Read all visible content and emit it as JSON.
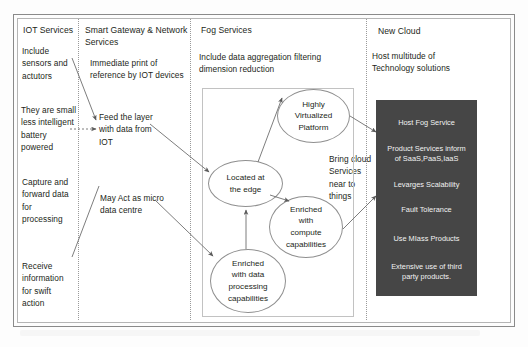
{
  "diagram": {
    "columns": [
      {
        "id": "iot",
        "header": "IOT Services",
        "notes": [
          "Include\nsensors and\nactutors",
          "They are small\nless intelligent\nbattery\npowered",
          "Capture and\nforward data\nfor\nprocessing",
          "Receive\ninformation\nfor swift\naction"
        ]
      },
      {
        "id": "gateway",
        "header": "Smart Gateway & Network\nServices",
        "notes": [
          "Immediate print of\nreference by IOT devices",
          "Feed the layer\nwith data from\nIOT",
          "May Act as micro\ndata centre"
        ]
      },
      {
        "id": "fog",
        "header": "Fog Services",
        "notes": [
          "Include data aggregation filtering\ndimension reduction",
          "Bring cloud\nServices\nnear to\nthings"
        ]
      },
      {
        "id": "cloud",
        "header": "New Cloud",
        "notes": [
          "Host multitude of\nTechnology solutions"
        ]
      }
    ],
    "fog_nodes": [
      {
        "id": "highly-virtualized-platform",
        "label": "Highly\nVirtualized\nPlatform"
      },
      {
        "id": "located-at-the-edge",
        "label": "Located at\nthe edge"
      },
      {
        "id": "enriched-with-compute-capabilities",
        "label": "Enriched\nwith\ncompute\ncapabilities"
      },
      {
        "id": "enriched-with-data-processing-capabilities",
        "label": "Enriched\nwith data\nprocessing\ncapabilities"
      }
    ],
    "cloud_panel": {
      "background_color": "#464646",
      "text_color": "#f2f2f2",
      "lines": [
        "Host Fog Service",
        "Product Services inform\nof SaaS,PaaS,IaaS",
        "Levarges Scalability",
        "Fault Tolerance",
        "Use MIass Products",
        "Extensive use of third\nparty products."
      ]
    }
  }
}
